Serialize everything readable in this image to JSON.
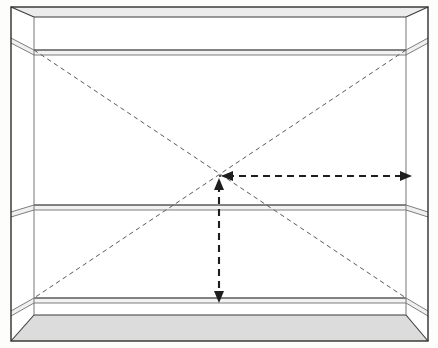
{
  "figure": {
    "canvas": {
      "width": 438,
      "height": 348
    },
    "background_color": "#fdfdfc",
    "line_color": "#3a3a3a",
    "thin_line_color": "#7d7d7d",
    "dashed_line_color": "#5a5a5a",
    "arrow_color": "#262626",
    "floor_fill": "#dcdcdc",
    "ceiling_fill": "#ececec",
    "side_fill": "#ffffff"
  },
  "geometry": {
    "outer_frame": {
      "top_left": [
        11,
        7
      ],
      "top_right": [
        428,
        7
      ],
      "bottom_right": [
        428,
        341
      ],
      "bottom_left": [
        11,
        341
      ]
    },
    "back_wall": {
      "top_left": [
        34,
        17
      ],
      "top_right": [
        406,
        17
      ],
      "bottom_right": [
        406,
        315
      ],
      "bottom_left": [
        34,
        315
      ]
    },
    "vanishing_point": [
      220,
      176
    ],
    "shelves": [
      {
        "name": "top-shelf",
        "front_left": [
          11,
          38
        ],
        "front_right": [
          428,
          38
        ],
        "back_left": [
          34,
          50
        ],
        "back_right": [
          406,
          50
        ],
        "band_height": 5
      },
      {
        "name": "middle-shelf",
        "front_left": [
          11,
          212
        ],
        "front_right": [
          428,
          212
        ],
        "back_left": [
          34,
          205
        ],
        "back_right": [
          406,
          205
        ],
        "band_height": 5
      },
      {
        "name": "bottom-shelf",
        "front_left": [
          11,
          311
        ],
        "front_right": [
          428,
          311
        ],
        "back_left": [
          34,
          298
        ],
        "back_right": [
          406,
          298
        ],
        "band_height": 5
      }
    ],
    "diagonals": [
      {
        "name": "diagonal-tl-br",
        "from": [
          34,
          50
        ],
        "to": [
          406,
          298
        ]
      },
      {
        "name": "diagonal-tr-bl",
        "from": [
          406,
          50
        ],
        "to": [
          34,
          298
        ]
      }
    ],
    "dimension_arrows": [
      {
        "name": "horizontal-width-arrow",
        "orientation": "horizontal",
        "from": [
          222,
          176
        ],
        "to": [
          411,
          176
        ],
        "double_headed": true
      },
      {
        "name": "vertical-height-arrow",
        "orientation": "vertical",
        "from": [
          219,
          178
        ],
        "to": [
          219,
          303
        ],
        "double_headed": true
      }
    ]
  },
  "labels": {
    "vanishing_point_label": "",
    "horizontal_arrow_label": "",
    "vertical_arrow_label": ""
  }
}
